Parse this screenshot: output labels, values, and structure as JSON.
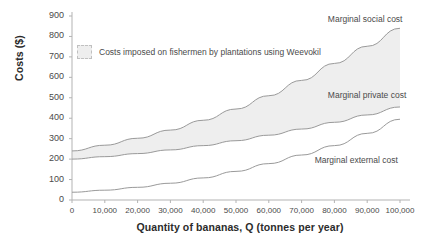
{
  "chart_data": {
    "type": "line",
    "title": "",
    "xlabel": "Quantity of bananas, Q (tonnes per year)",
    "ylabel": "Costs ($)",
    "xlim": [
      0,
      100000
    ],
    "ylim": [
      0,
      900
    ],
    "grid": false,
    "legend_position": "upper-left-inside",
    "x_ticks": [
      0,
      10000,
      20000,
      30000,
      40000,
      50000,
      60000,
      70000,
      80000,
      90000,
      100000
    ],
    "x_tick_labels": [
      "0",
      "10,000",
      "20,000",
      "30,000",
      "40,000",
      "50,000",
      "60,000",
      "70,000",
      "80,000",
      "90,000",
      "100,000"
    ],
    "y_ticks": [
      0,
      100,
      200,
      300,
      400,
      500,
      600,
      700,
      800,
      900
    ],
    "y_tick_labels": [
      "0",
      "100",
      "200",
      "300",
      "400",
      "500",
      "600",
      "700",
      "800",
      "900"
    ],
    "x": [
      0,
      10000,
      20000,
      30000,
      40000,
      50000,
      60000,
      70000,
      80000,
      90000,
      100000
    ],
    "series": [
      {
        "name": "Marginal social cost",
        "values": [
          240,
          268,
          302,
          342,
          390,
          445,
          510,
          585,
          668,
          752,
          840
        ],
        "color": "#9a9a9a"
      },
      {
        "name": "Marginal private cost",
        "values": [
          200,
          212,
          227,
          245,
          266,
          290,
          317,
          347,
          380,
          416,
          455
        ],
        "color": "#9a9a9a"
      },
      {
        "name": "Marginal external cost",
        "values": [
          38,
          48,
          62,
          82,
          108,
          140,
          178,
          220,
          266,
          326,
          395
        ],
        "color": "#9a9a9a"
      }
    ],
    "shaded_band": {
      "label": "Costs imposed on fishermen by plantations using Weevokil",
      "between": [
        "Marginal social cost",
        "Marginal private cost"
      ],
      "fill_color": "#eeeeee"
    },
    "annotations": [
      {
        "text": "Marginal social cost",
        "x": 78000,
        "y": 880
      },
      {
        "text": "Marginal private cost",
        "x": 78000,
        "y": 510
      },
      {
        "text": "Marginal external cost",
        "x": 74000,
        "y": 190
      }
    ]
  },
  "legend": {
    "swatch_label": "Costs imposed on fishermen by plantations using Weevokil"
  },
  "colors": {
    "background": "#ffffff",
    "axis": "#b3b3b3",
    "curve": "#9a9a9a",
    "band_fill": "#eeeeee",
    "text": "#4a4a4a",
    "title_text": "#2b2b2b"
  }
}
